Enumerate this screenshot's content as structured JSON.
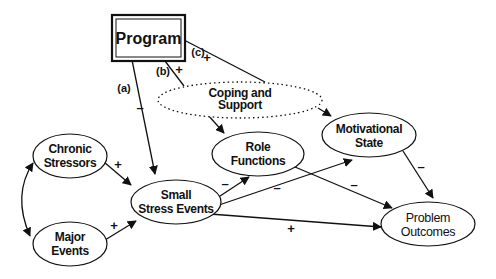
{
  "nodes": {
    "program": {
      "label": "Program"
    },
    "coping": {
      "line1": "Coping and",
      "line2": "Support"
    },
    "chronic": {
      "line1": "Chronic",
      "line2": "Stressors"
    },
    "major": {
      "line1": "Major",
      "line2": "Events"
    },
    "small": {
      "line1": "Small",
      "line2": "Stress Events"
    },
    "role": {
      "line1": "Role",
      "line2": "Functions"
    },
    "motivational": {
      "line1": "Motivational",
      "line2": "State"
    },
    "problem": {
      "line1": "Problem",
      "line2": "Outcomes"
    }
  },
  "paths": {
    "a": "(a)",
    "b": "(b)",
    "c": "(c)"
  },
  "signs": {
    "program_small": "–",
    "program_coping": "+",
    "program_motivational": "+",
    "chronic_small": "+",
    "major_small": "+",
    "small_role": "–",
    "small_motivational": "–",
    "small_problem": "+",
    "role_problem": "–",
    "motivational_problem": "–"
  }
}
